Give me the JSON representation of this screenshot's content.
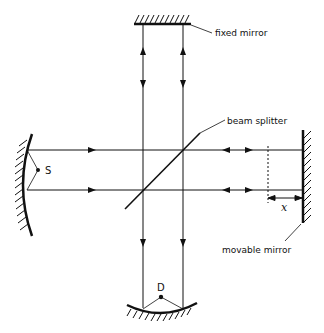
{
  "diagram": {
    "type": "Michelson interferometer schematic",
    "labels": {
      "fixed_mirror": "fixed mirror",
      "beam_splitter": "beam splitter",
      "movable_mirror": "movable mirror",
      "source": "S",
      "detector": "D",
      "displacement": "x"
    },
    "components": [
      {
        "id": "fixed-mirror",
        "label": "fixed mirror",
        "kind": "flat mirror",
        "position": "top"
      },
      {
        "id": "beam-splitter",
        "label": "beam splitter",
        "kind": "diagonal plate",
        "position": "center"
      },
      {
        "id": "movable-mirror",
        "label": "movable mirror",
        "kind": "flat mirror",
        "position": "right"
      },
      {
        "id": "source-mirror",
        "label": "S",
        "kind": "concave mirror with source",
        "position": "left"
      },
      {
        "id": "detector-mirror",
        "label": "D",
        "kind": "concave mirror with detector",
        "position": "bottom"
      }
    ],
    "colors": {
      "line": "#111111",
      "background": "#ffffff"
    }
  }
}
